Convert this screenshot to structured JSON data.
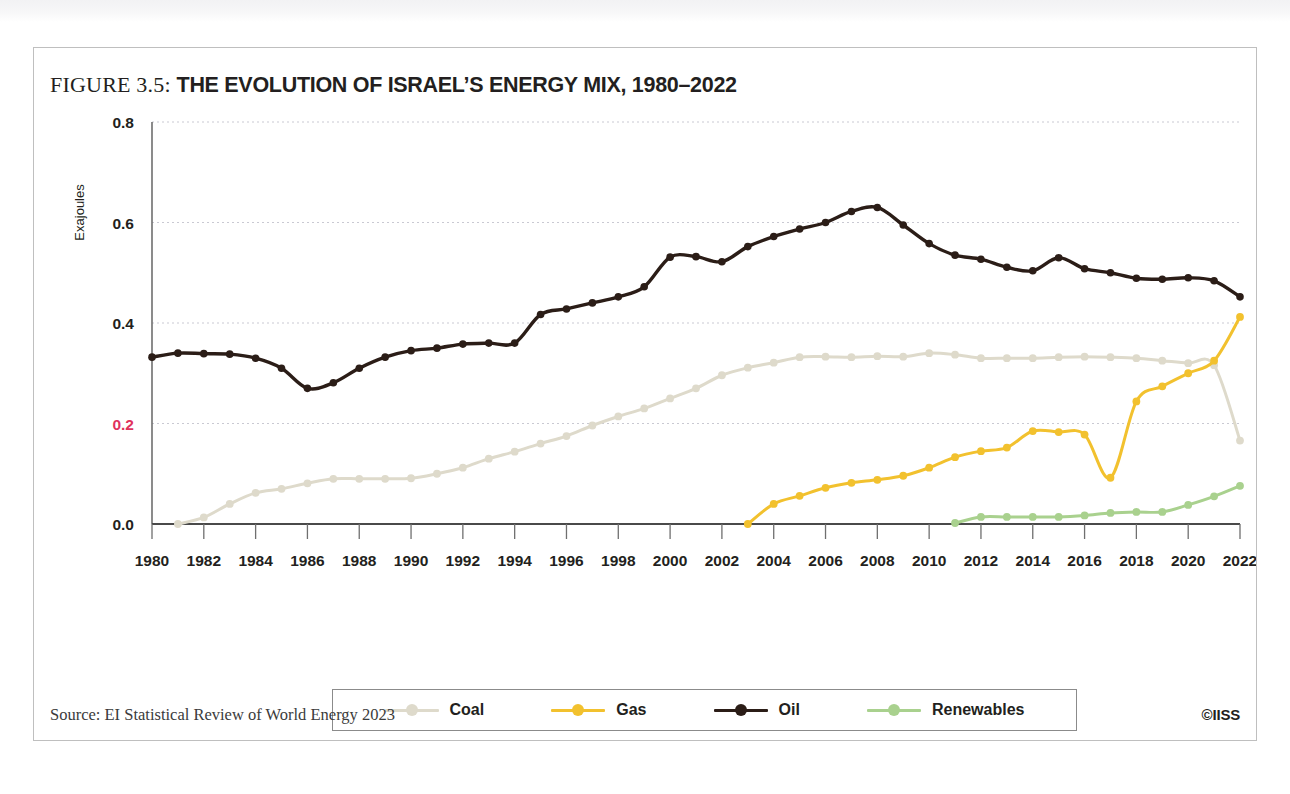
{
  "figure": {
    "number_label": "FIGURE 3.5:",
    "title": "THE EVOLUTION OF ISRAEL’S ENERGY MIX, 1980–2022",
    "source": "Source: EI Statistical Review of World Energy 2023",
    "credit": "©IISS"
  },
  "legend": {
    "position": "bottom-center",
    "entries": [
      {
        "label": "Coal",
        "color": "#dedacb"
      },
      {
        "label": "Gas",
        "color": "#f2c12e"
      },
      {
        "label": "Oil",
        "color": "#2b1d17"
      },
      {
        "label": "Renewables",
        "color": "#a9d18e"
      }
    ]
  },
  "axes": {
    "y_title": "Exajoules",
    "y_ticks": [
      "0.0",
      "0.2",
      "0.4",
      "0.6",
      "0.8"
    ],
    "y_tick_accent_index": 1,
    "y_accent_color": "#e0325c",
    "x_ticks": [
      "1980",
      "1982",
      "1984",
      "1986",
      "1988",
      "1990",
      "1992",
      "1994",
      "1996",
      "1998",
      "2000",
      "2002",
      "2004",
      "2006",
      "2008",
      "2010",
      "2012",
      "2014",
      "2016",
      "2018",
      "2020",
      "2022"
    ]
  },
  "chart_data": {
    "type": "line",
    "title": "THE EVOLUTION OF ISRAEL’S ENERGY MIX, 1980–2022",
    "xlabel": "",
    "ylabel": "Exajoules",
    "xlim": [
      1980,
      2022
    ],
    "ylim": [
      0.0,
      0.8
    ],
    "grid": true,
    "x": [
      1980,
      1981,
      1982,
      1983,
      1984,
      1985,
      1986,
      1987,
      1988,
      1989,
      1990,
      1991,
      1992,
      1993,
      1994,
      1995,
      1996,
      1997,
      1998,
      1999,
      2000,
      2001,
      2002,
      2003,
      2004,
      2005,
      2006,
      2007,
      2008,
      2009,
      2010,
      2011,
      2012,
      2013,
      2014,
      2015,
      2016,
      2017,
      2018,
      2019,
      2020,
      2021,
      2022
    ],
    "series": [
      {
        "name": "Coal",
        "color": "#dedacb",
        "values": [
          null,
          0.0,
          0.013,
          0.04,
          0.062,
          0.07,
          0.081,
          0.09,
          0.09,
          0.09,
          0.091,
          0.1,
          0.112,
          0.13,
          0.144,
          0.16,
          0.175,
          0.196,
          0.214,
          0.23,
          0.25,
          0.27,
          0.296,
          0.311,
          0.321,
          0.332,
          0.333,
          0.332,
          0.334,
          0.333,
          0.34,
          0.337,
          0.33,
          0.33,
          0.33,
          0.332,
          0.333,
          0.332,
          0.33,
          0.325,
          0.32,
          0.316,
          0.166
        ]
      },
      {
        "name": "Gas",
        "color": "#f2c12e",
        "values": [
          null,
          null,
          null,
          null,
          null,
          null,
          null,
          null,
          null,
          null,
          null,
          null,
          null,
          null,
          null,
          null,
          null,
          null,
          null,
          null,
          null,
          null,
          null,
          0.0,
          0.04,
          0.056,
          0.072,
          0.082,
          0.088,
          0.096,
          0.112,
          0.133,
          0.145,
          0.152,
          0.185,
          0.183,
          0.178,
          0.092,
          0.244,
          0.274,
          0.3,
          0.325,
          0.412
        ]
      },
      {
        "name": "Oil",
        "color": "#2b1d17",
        "values": [
          0.332,
          0.34,
          0.339,
          0.338,
          0.33,
          0.31,
          0.27,
          0.281,
          0.31,
          0.332,
          0.345,
          0.35,
          0.358,
          0.36,
          0.36,
          0.417,
          0.428,
          0.44,
          0.452,
          0.472,
          0.531,
          0.532,
          0.522,
          0.552,
          0.572,
          0.587,
          0.6,
          0.622,
          0.63,
          0.595,
          0.558,
          0.535,
          0.527,
          0.511,
          0.504,
          0.53,
          0.508,
          0.5,
          0.489,
          0.487,
          0.49,
          0.484,
          0.452
        ]
      },
      {
        "name": "Renewables",
        "color": "#a9d18e",
        "values": [
          null,
          null,
          null,
          null,
          null,
          null,
          null,
          null,
          null,
          null,
          null,
          null,
          null,
          null,
          null,
          null,
          null,
          null,
          null,
          null,
          null,
          null,
          null,
          null,
          null,
          null,
          null,
          null,
          null,
          null,
          null,
          0.002,
          0.014,
          0.014,
          0.014,
          0.014,
          0.017,
          0.022,
          0.024,
          0.024,
          0.038,
          0.055,
          0.076
        ]
      }
    ],
    "series_aligned_note": "Values are plotted against x year-by-year; nulls mark years before a fuel appears in the mix."
  }
}
